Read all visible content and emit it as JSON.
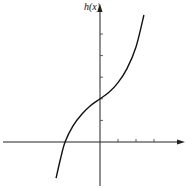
{
  "chart_data": {
    "type": "line",
    "title": "",
    "xlabel": "",
    "ylabel": "h(x)",
    "grid": false,
    "legend": null,
    "x_ticks_positive": [
      1,
      2,
      3
    ],
    "y_ticks_positive": [
      1,
      2,
      3,
      4,
      5
    ],
    "xlim": [
      -5.4,
      4.8
    ],
    "ylim": [
      -2.0,
      6.4
    ],
    "series": [
      {
        "name": "h(x)",
        "x": [
          -2.44,
          -2.2,
          -1.94,
          -1.5,
          -1.0,
          -0.5,
          0.0,
          0.5,
          1.0,
          1.5,
          2.0,
          2.44
        ],
        "y": [
          -1.67,
          -0.8,
          0.0,
          0.75,
          1.3,
          1.7,
          2.0,
          2.3,
          2.75,
          3.4,
          4.4,
          5.88
        ]
      }
    ],
    "annotations": [
      {
        "type": "point",
        "x": 0,
        "y": 2,
        "label": "y-intercept"
      },
      {
        "type": "point",
        "x": -1.94,
        "y": 0,
        "label": "x-intercept"
      }
    ]
  },
  "labels": {
    "y_axis": "h(x)"
  }
}
